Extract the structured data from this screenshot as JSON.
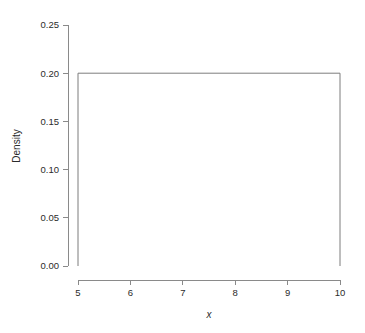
{
  "chart_data": {
    "type": "line",
    "title": "",
    "subtitle": "",
    "xlabel": "x",
    "ylabel": "Density",
    "xlim": [
      5,
      10
    ],
    "ylim": [
      0.0,
      0.25
    ],
    "xticks": [
      "5",
      "6",
      "7",
      "8",
      "9",
      "10"
    ],
    "xtick_values": [
      5,
      6,
      7,
      8,
      9,
      10
    ],
    "yticks": [
      "0.00",
      "0.05",
      "0.10",
      "0.15",
      "0.20",
      "0.25"
    ],
    "ytick_values": [
      0.0,
      0.05,
      0.1,
      0.15,
      0.2,
      0.25
    ],
    "grid": false,
    "legend": null,
    "annotations": [],
    "series": [
      {
        "name": "Uniform(5, 10) density",
        "x": [
          5,
          5,
          10,
          10
        ],
        "values": [
          0,
          0.2,
          0.2,
          0
        ],
        "color": "#7d7d7d"
      }
    ],
    "distribution": {
      "family": "uniform",
      "min": 5,
      "max": 10,
      "density": 0.2
    }
  },
  "style": {
    "background": "#ffffff",
    "axis_color": "#8a8a8a",
    "text_color": "#2b2b2b",
    "line_color": "#7d7d7d"
  }
}
